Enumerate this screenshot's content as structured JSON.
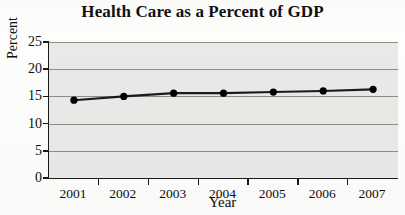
{
  "chart_data": {
    "type": "line",
    "title": "Health Care as a Percent of GDP",
    "xlabel": "Year",
    "ylabel": "Percent",
    "categories": [
      "2001",
      "2002",
      "2003",
      "2004",
      "2005",
      "2006",
      "2007"
    ],
    "values": [
      14.3,
      15.0,
      15.6,
      15.6,
      15.8,
      16.0,
      16.3
    ],
    "series": [
      {
        "name": "Health care spending as percent of GDP",
        "values": [
          14.3,
          15.0,
          15.6,
          15.6,
          15.8,
          16.0,
          16.3
        ]
      }
    ],
    "ylim": [
      0,
      25
    ],
    "yticks": [
      0,
      5,
      10,
      15,
      20,
      25
    ],
    "ytick_labels": [
      "0",
      "5",
      "10",
      "15",
      "20",
      "25"
    ],
    "grid": true,
    "legend": "none",
    "marker": "filled-circle",
    "line_color": "#1a1a1a",
    "marker_color": "#000000",
    "plot_background": "#e9e9e7",
    "gridline_color": "#8d8d8a",
    "axis_color": "#1a1a1a"
  }
}
